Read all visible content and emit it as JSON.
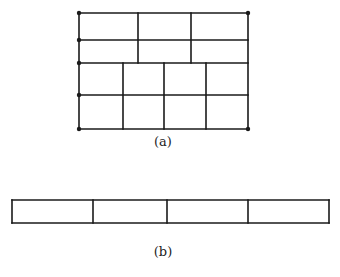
{
  "figure_a": {
    "label": "(a)",
    "outer": {
      "x1": 79,
      "y1": 13,
      "x2": 248,
      "y2": 129
    },
    "horizontal_lines_y": [
      13,
      40,
      63,
      95,
      129
    ],
    "upper_band": {
      "y1": 13,
      "y2": 63,
      "verticals_x": [
        138,
        191
      ]
    },
    "lower_band": {
      "y1": 63,
      "y2": 129,
      "verticals_x": [
        123,
        164,
        206
      ]
    },
    "dots": [
      {
        "x": 79,
        "y": 13
      },
      {
        "x": 79,
        "y": 40
      },
      {
        "x": 79,
        "y": 63
      },
      {
        "x": 79,
        "y": 95
      },
      {
        "x": 79,
        "y": 129
      },
      {
        "x": 248,
        "y": 13
      },
      {
        "x": 248,
        "y": 129
      }
    ],
    "label_pos": {
      "x": 163,
      "y": 146
    }
  },
  "figure_b": {
    "label": "(b)",
    "outer": {
      "x1": 12,
      "y1": 200,
      "x2": 329,
      "y2": 223
    },
    "verticals_x": [
      93,
      167,
      248
    ],
    "label_pos": {
      "x": 163,
      "y": 256
    }
  },
  "colors": {
    "stroke": "#1a1a1a",
    "background": "#ffffff"
  }
}
